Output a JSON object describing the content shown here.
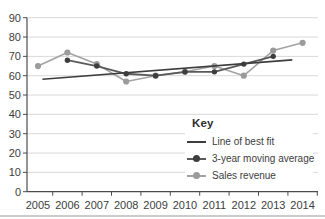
{
  "chart_data": {
    "type": "line",
    "title": "",
    "xlabel": "",
    "ylabel": "",
    "x_categories": [
      "2005",
      "2006",
      "2007",
      "2008",
      "2009",
      "2010",
      "2011",
      "2012",
      "2013",
      "2014"
    ],
    "ylim": [
      0,
      90
    ],
    "ytick_step": 10,
    "grid": true,
    "series": [
      {
        "name": "Sales revenue",
        "x": [
          2005,
          2006,
          2007,
          2008,
          2009,
          2010,
          2011,
          2012,
          2013,
          2014
        ],
        "values": [
          65,
          72,
          66,
          57,
          60,
          62,
          65,
          60,
          73,
          77
        ],
        "color": "#a3a3a3",
        "marker": true,
        "marker_color": "#9b9b9b",
        "marker_radius": 3.1,
        "line_width": 1.6
      },
      {
        "name": "3-year moving average",
        "x": [
          2006,
          2007,
          2008,
          2009,
          2010,
          2011,
          2012,
          2013
        ],
        "values": [
          68,
          65,
          61,
          60,
          62,
          62,
          66,
          70
        ],
        "color": "#5a5a5a",
        "marker": true,
        "marker_color": "#3d3d3d",
        "marker_radius": 2.7,
        "line_width": 1.8
      },
      {
        "name": "Line of best fit",
        "color": "#3d3d3d",
        "line_width": 1.6,
        "trend": {
          "x1": 2005.15,
          "y1": 58.2,
          "x2": 2013.65,
          "y2": 68.2
        }
      }
    ],
    "legend": {
      "title": "Key",
      "position": "bottom-right",
      "items": [
        {
          "label": "Line of best fit",
          "color": "#3d3d3d",
          "marker": false
        },
        {
          "label": "3-year moving average",
          "color": "#5a5a5a",
          "marker": true,
          "marker_color": "#3d3d3d"
        },
        {
          "label": "Sales revenue",
          "color": "#a3a3a3",
          "marker": true,
          "marker_color": "#9b9b9b"
        }
      ]
    },
    "colors": {
      "grid": "#d8d8d8",
      "axis": "#4c4c4c",
      "text": "#3d3d3d",
      "background": "#ffffff"
    }
  }
}
